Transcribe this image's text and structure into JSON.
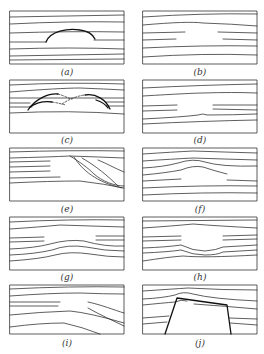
{
  "figure": {
    "panels": [
      {
        "id": "a",
        "label": "(a)",
        "description": "horizontal layers with a dome-shaped arch (bold) in the middle"
      },
      {
        "id": "b",
        "label": "(b)",
        "description": "horizontal layers with a central gap where lines terminate"
      },
      {
        "id": "c",
        "label": "(c)",
        "description": "horizontal layers crossed by two overlapping curved arcs, dashed in the middle"
      },
      {
        "id": "d",
        "label": "(d)",
        "description": "layers with wide central gap; lower lines slightly bulge"
      },
      {
        "id": "e",
        "label": "(e)",
        "description": "layers truncated by sloping curved lines toward lower right"
      },
      {
        "id": "f",
        "label": "(f)",
        "description": "layers bending upward over a central gap"
      },
      {
        "id": "g",
        "label": "(g)",
        "description": "layers with central gap; lines below bow upward"
      },
      {
        "id": "h",
        "label": "(h)",
        "description": "layers with central gap; upper line arched and lower lines dipping"
      },
      {
        "id": "i",
        "label": "(i)",
        "description": "layers converging and dipping to the right"
      },
      {
        "id": "j",
        "label": "(j)",
        "description": "layers draped over a trapezoidal block at the base"
      }
    ]
  }
}
